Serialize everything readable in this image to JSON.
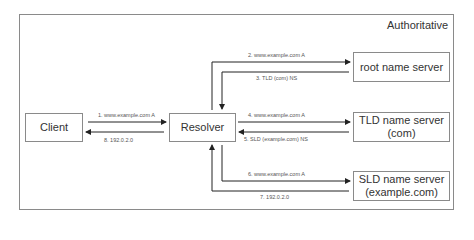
{
  "diagram": {
    "region_title": "Authoritative",
    "nodes": {
      "client": "Client",
      "resolver": "Resolver",
      "root": "root name server",
      "tld_line1": "TLD name server",
      "tld_line2": "(com)",
      "sld_line1": "SLD name server",
      "sld_line2": "(example.com)"
    },
    "steps": [
      {
        "label": "1. www.example.com A",
        "from": "Client",
        "to": "Resolver"
      },
      {
        "label": "2. www.example.com A",
        "from": "Resolver",
        "to": "root name server"
      },
      {
        "label": "3. TLD (com) NS",
        "from": "root name server",
        "to": "Resolver"
      },
      {
        "label": "4. www.example.com A",
        "from": "Resolver",
        "to": "TLD name server (com)"
      },
      {
        "label": "5. SLD (example.com) NS",
        "from": "TLD name server (com)",
        "to": "Resolver"
      },
      {
        "label": "6. www.example.com A",
        "from": "Resolver",
        "to": "SLD name server (example.com)"
      },
      {
        "label": "7. 192.0.2.0",
        "from": "SLD name server (example.com)",
        "to": "Resolver"
      },
      {
        "label": "8. 192.0.2.0",
        "from": "Resolver",
        "to": "Client"
      }
    ],
    "colors": {
      "line": "#222222",
      "border": "#8a8a8a"
    }
  }
}
